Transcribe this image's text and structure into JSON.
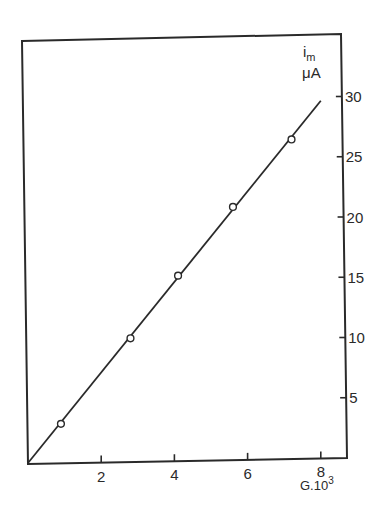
{
  "chart_data": {
    "type": "line",
    "title": "",
    "xlabel": "G.10",
    "xlabel_superscript": "3",
    "ylabel": "i",
    "ylabel_subscript": "m",
    "ylabel_unit": "μA",
    "xlim": [
      0,
      8.5
    ],
    "ylim": [
      0,
      33
    ],
    "x_ticks": [
      2,
      4,
      6,
      8
    ],
    "x_tick_labels": [
      "2",
      "4",
      "6",
      "8"
    ],
    "y_ticks": [
      5,
      10,
      15,
      20,
      25,
      30
    ],
    "y_tick_labels": [
      "5",
      "10",
      "15",
      "20",
      "25",
      "30"
    ],
    "y_axis_position": "right",
    "grid": false,
    "legend": null,
    "series": [
      {
        "name": "measured",
        "style": "open-circle markers",
        "x": [
          0.9,
          2.8,
          4.1,
          5.6,
          7.2
        ],
        "y": [
          3.0,
          10.1,
          15.3,
          21.0,
          26.6
        ]
      },
      {
        "name": "fit line",
        "style": "solid line through origin",
        "x": [
          0,
          8.0
        ],
        "y": [
          0,
          29.9
        ]
      }
    ]
  },
  "colors": {
    "ink": "#2a2a2a",
    "background": "#ffffff"
  }
}
